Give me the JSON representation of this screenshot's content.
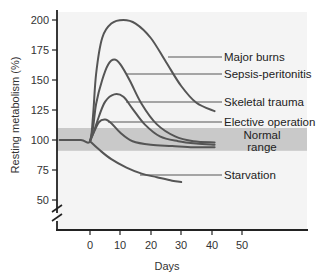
{
  "chart_data": {
    "type": "line",
    "title": "",
    "xlabel": "Days",
    "ylabel": "Resting metabolism (%)",
    "xlim": [
      -10,
      58
    ],
    "ylim": [
      40,
      205
    ],
    "x_ticks": [
      0,
      10,
      20,
      30,
      40,
      50
    ],
    "y_ticks": [
      50,
      75,
      100,
      125,
      150,
      175,
      200
    ],
    "y_axis_break": true,
    "grid": false,
    "legend": "direct-labels-right",
    "normal_range": {
      "label_line1": "Normal",
      "label_line2": "range",
      "low": 91,
      "high": 110,
      "color": "#c9c9c9"
    },
    "series": [
      {
        "name": "Major burns",
        "x": [
          -10,
          -3,
          0,
          1,
          2,
          4,
          7,
          11,
          15,
          20,
          25,
          30,
          35,
          41
        ],
        "y": [
          100,
          100,
          99,
          120,
          155,
          185,
          197,
          200,
          197,
          185,
          165,
          145,
          131,
          124
        ]
      },
      {
        "name": "Sepsis-peritonitis",
        "x": [
          0,
          1,
          2,
          4,
          6,
          8,
          10,
          13,
          17,
          22,
          28,
          34,
          41
        ],
        "y": [
          99,
          110,
          130,
          150,
          163,
          167,
          163,
          150,
          130,
          113,
          103,
          99,
          98
        ]
      },
      {
        "name": "Skeletal trauma",
        "x": [
          0,
          1,
          3,
          5,
          8,
          11,
          14,
          18,
          23,
          29,
          35,
          41
        ],
        "y": [
          99,
          105,
          120,
          132,
          138,
          136,
          126,
          113,
          103,
          99,
          97,
          96
        ]
      },
      {
        "name": "Elective operation",
        "x": [
          0,
          1,
          3,
          5,
          7,
          10,
          14,
          20,
          27,
          34,
          41
        ],
        "y": [
          99,
          105,
          115,
          117,
          114,
          106,
          99,
          96,
          95,
          94,
          94
        ]
      },
      {
        "name": "Starvation",
        "x": [
          0,
          3,
          7,
          12,
          17,
          22,
          27,
          30
        ],
        "y": [
          99,
          92,
          84,
          77,
          72,
          69,
          66,
          65
        ]
      }
    ],
    "line_color": "#555555"
  },
  "labels": {
    "y_ticks": [
      "200",
      "175",
      "150",
      "125",
      "100",
      "75",
      "50"
    ],
    "x_ticks": [
      "0",
      "10",
      "20",
      "30",
      "40",
      "50"
    ],
    "ylabel": "Resting metabolism (%)",
    "xlabel": "Days",
    "series": [
      "Major burns",
      "Sepsis-peritonitis",
      "Skeletal trauma",
      "Elective operation",
      "Starvation"
    ],
    "normal_line1": "Normal",
    "normal_line2": "range"
  }
}
